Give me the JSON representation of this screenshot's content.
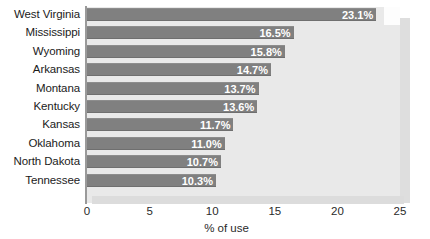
{
  "chart_data": {
    "type": "bar",
    "orientation": "horizontal",
    "title": "",
    "xlabel": "% of use",
    "ylabel": "",
    "xlim": [
      0,
      25
    ],
    "xticks": [
      "0",
      "5",
      "10",
      "15",
      "20",
      "25"
    ],
    "grid": false,
    "legend": false,
    "categories": [
      "West Virginia",
      "Mississippi",
      "Wyoming",
      "Arkansas",
      "Montana",
      "Kentucky",
      "Kansas",
      "Oklahoma",
      "North Dakota",
      "Tennessee"
    ],
    "values": [
      23.1,
      16.5,
      15.8,
      14.7,
      13.7,
      13.6,
      11.7,
      11.0,
      10.7,
      10.3
    ],
    "value_labels": [
      "23.1%",
      "16.5%",
      "15.8%",
      "14.7%",
      "13.7%",
      "13.6%",
      "11.7%",
      "11.0%",
      "10.7%",
      "10.3%"
    ]
  },
  "colors": {
    "bar_fill": "#808080",
    "plot_background": "#e9e9e9",
    "page_background": "#ffffff",
    "value_label": "#ffffff",
    "axis_text": "#1b1b1b",
    "axis_spine": "#9a9a9a"
  }
}
